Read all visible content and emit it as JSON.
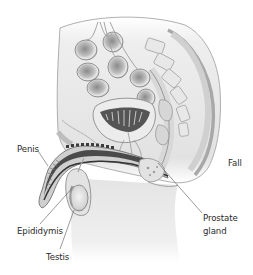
{
  "figure": {
    "labels": [
      {
        "id": "penis",
        "text": "Penis"
      },
      {
        "id": "epididymis",
        "text": "Epididymis"
      },
      {
        "id": "testis",
        "text": "Testis"
      },
      {
        "id": "prostate",
        "line1": "Prostate",
        "line2": "gland"
      },
      {
        "id": "adjacent-cutoff",
        "text": "Fall"
      }
    ],
    "colors": {
      "background": "#ffffff",
      "label_text": "#2a2a2a",
      "leader_line": "#555555",
      "tissue_light": "#e6e6e6",
      "tissue_mid": "#c4c4c4",
      "tissue_dark": "#4a4a4a",
      "outline": "#8a8a8a"
    }
  }
}
